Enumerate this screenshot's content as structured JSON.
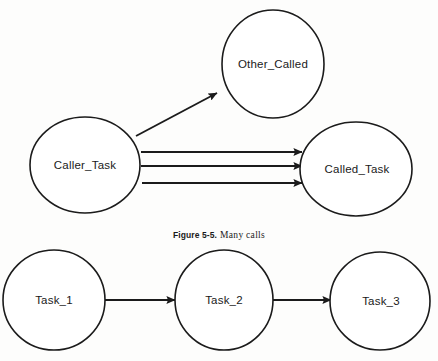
{
  "figure": {
    "caption_number": "Figure 5-5.",
    "caption_text": "Many calls",
    "background_color": "#fdfdfc",
    "ink_color": "#1b1b1b"
  },
  "diagram_data": {
    "type": "diagram",
    "style": "node-link call graph",
    "nodes": [
      {
        "id": "other_called",
        "label": "Other_Called",
        "cx": 273,
        "cy": 64,
        "rx": 51,
        "ry": 54
      },
      {
        "id": "caller_task",
        "label": "Caller_Task",
        "cx": 85,
        "cy": 165,
        "rx": 55,
        "ry": 48
      },
      {
        "id": "called_task",
        "label": "Called_Task",
        "cx": 356,
        "cy": 169,
        "rx": 56,
        "ry": 47
      },
      {
        "id": "task_1",
        "label": "Task_1",
        "cx": 54,
        "cy": 300,
        "rx": 51,
        "ry": 50
      },
      {
        "id": "task_2",
        "label": "Task_2",
        "cx": 224,
        "cy": 300,
        "rx": 49,
        "ry": 50
      },
      {
        "id": "task_3",
        "label": "Task_3",
        "cx": 380,
        "cy": 301,
        "rx": 50,
        "ry": 49
      }
    ],
    "edges": [
      {
        "from": "caller_task",
        "to": "other_called",
        "kind": "diagonal",
        "x1": 136,
        "y1": 136,
        "x2": 218,
        "y2": 93
      },
      {
        "from": "caller_task",
        "to": "called_task",
        "kind": "horizontal",
        "x1": 141,
        "y1": 152,
        "x2": 303,
        "y2": 152
      },
      {
        "from": "caller_task",
        "to": "called_task",
        "kind": "horizontal",
        "x1": 141,
        "y1": 166,
        "x2": 303,
        "y2": 166
      },
      {
        "from": "caller_task",
        "to": "called_task",
        "kind": "horizontal",
        "x1": 142,
        "y1": 183,
        "x2": 303,
        "y2": 183
      },
      {
        "from": "task_1",
        "to": "task_2",
        "kind": "horizontal",
        "x1": 105,
        "y1": 300,
        "x2": 176,
        "y2": 300
      },
      {
        "from": "task_2",
        "to": "task_3",
        "kind": "horizontal",
        "x1": 273,
        "y1": 300,
        "x2": 332,
        "y2": 300
      }
    ]
  }
}
